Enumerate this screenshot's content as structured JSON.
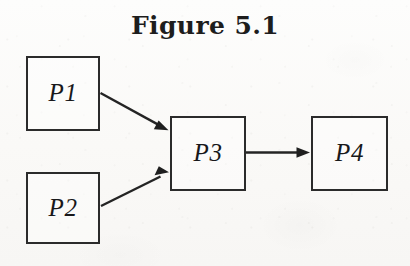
{
  "figure": {
    "title": "Figure 5.1",
    "type": "process-flow-diagram",
    "background_color": "#fbfbf9",
    "stroke_color": "#242424",
    "label_color": "#18181a"
  },
  "nodes": [
    {
      "id": "P1",
      "label": "P1",
      "x": 26,
      "y": 56,
      "width": 74,
      "height": 75
    },
    {
      "id": "P2",
      "label": "P2",
      "x": 26,
      "y": 172,
      "width": 74,
      "height": 72
    },
    {
      "id": "P3",
      "label": "P3",
      "x": 170,
      "y": 116,
      "width": 76,
      "height": 75
    },
    {
      "id": "P4",
      "label": "P4",
      "x": 311,
      "y": 116,
      "width": 77,
      "height": 75
    }
  ],
  "edges": [
    {
      "id": "p1-p3",
      "from": "P1",
      "to": "P3",
      "direction": "down-right",
      "arrowhead": "filled-triangle"
    },
    {
      "id": "p2-p3",
      "from": "P2",
      "to": "P3",
      "direction": "up-right",
      "arrowhead": "filled-triangle"
    },
    {
      "id": "p3-p4",
      "from": "P3",
      "to": "P4",
      "direction": "right",
      "arrowhead": "filled-triangle"
    }
  ]
}
